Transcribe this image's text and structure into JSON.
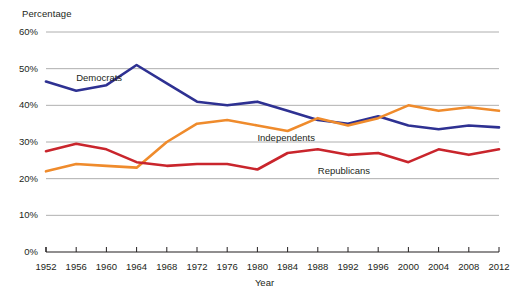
{
  "chart_data": {
    "type": "line",
    "title": "",
    "xlabel": "Year",
    "ylabel": "Percentage",
    "grid": true,
    "legend_position": "inline-labels",
    "xlim": [
      1952,
      2012
    ],
    "ylim": [
      0,
      60
    ],
    "ytick_labels": [
      "0%",
      "10%",
      "20%",
      "30%",
      "40%",
      "50%",
      "60%"
    ],
    "ytick_values": [
      0,
      10,
      20,
      30,
      40,
      50,
      60
    ],
    "x": [
      1952,
      1956,
      1960,
      1964,
      1968,
      1972,
      1976,
      1980,
      1984,
      1988,
      1992,
      1996,
      2000,
      2004,
      2008,
      2012
    ],
    "xtick_labels": [
      "1952",
      "1956",
      "1960",
      "1964",
      "1968",
      "1972",
      "1976",
      "1980",
      "1984",
      "1988",
      "1992",
      "1996",
      "2000",
      "2004",
      "2008",
      "2012"
    ],
    "series": [
      {
        "name": "Democrats",
        "color": "#2e3192",
        "label_x": 1956,
        "label_y": 47.5,
        "values": [
          46.5,
          44.0,
          45.5,
          51.0,
          46.0,
          41.0,
          40.0,
          41.0,
          38.5,
          36.0,
          35.0,
          37.0,
          34.5,
          33.5,
          34.5,
          34.0
        ]
      },
      {
        "name": "Independents",
        "color": "#ef8b2c",
        "label_x": 1980,
        "label_y": 31.0,
        "values": [
          22.0,
          24.0,
          23.5,
          23.0,
          30.0,
          35.0,
          36.0,
          34.5,
          33.0,
          36.5,
          34.5,
          36.5,
          40.0,
          38.5,
          39.5,
          38.5
        ]
      },
      {
        "name": "Republicans",
        "color": "#c9252c",
        "label_x": 1988,
        "label_y": 22.0,
        "values": [
          27.5,
          29.5,
          28.0,
          24.5,
          23.5,
          24.0,
          24.0,
          22.5,
          27.0,
          28.0,
          26.5,
          27.0,
          24.5,
          28.0,
          26.5,
          28.0
        ]
      }
    ]
  }
}
